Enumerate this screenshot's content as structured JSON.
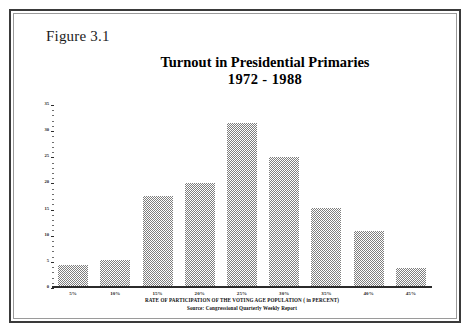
{
  "figure": {
    "label": "Figure 3.1"
  },
  "chart_data": {
    "type": "bar",
    "title": "Turnout in Presidential Primaries",
    "subtitle": "1972 - 1988",
    "xlabel": "RATE OF PARTICIPATION OF THE VOTING AGE POPULATION ( in  PERCENT)",
    "ylabel": "",
    "source": "Source: Congressional Quarterly Weekly  Report",
    "categories": [
      "5%",
      "10%",
      "15%",
      "20%",
      "25%",
      "30%",
      "35%",
      "40%",
      "45%"
    ],
    "values": [
      4,
      5,
      17.5,
      20,
      31.5,
      25,
      15,
      10.7,
      3.5
    ],
    "ylim": [
      0,
      35
    ],
    "yticks": [
      "35",
      "30",
      "25",
      "20",
      "15",
      "10",
      "5",
      "0"
    ],
    "ytick_values": [
      35,
      30,
      25,
      20,
      15,
      10,
      5,
      0
    ],
    "minor_tick_step": 1,
    "grid": false,
    "legend": null,
    "bar_color": "#7e7e7e",
    "bar_fill_style": "checkerboard-dither",
    "axis_color": "#2b2b2b"
  }
}
